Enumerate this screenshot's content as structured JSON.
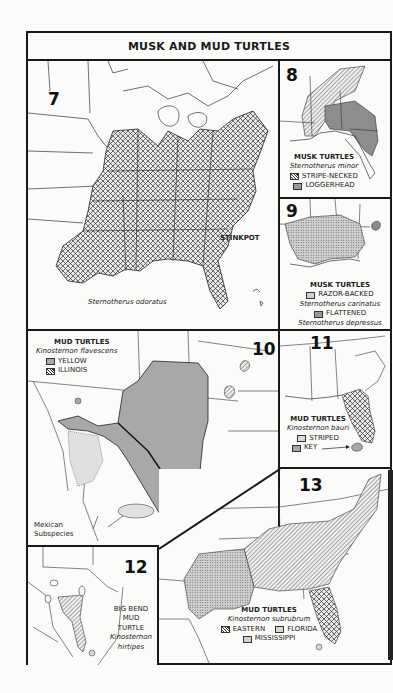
{
  "page": {
    "title": "MUSK AND MUD TURTLES"
  },
  "colors": {
    "ink": "#1a1a1a",
    "paper": "#fbfbf9",
    "gray_fill": "#a8a8a8",
    "light_fill": "#d6d6d6"
  },
  "maps": [
    {
      "number": "7",
      "common_name": "STINKPOT",
      "scientific_name": "Sternotherus odoratus",
      "pattern": "crosshatch"
    },
    {
      "number": "8",
      "group": "MUSK TURTLES",
      "scientific_name": "Sternotherus minor",
      "legend": [
        {
          "label": "STRIPE-NECKED",
          "pattern": "diagonal-hatch"
        },
        {
          "label": "LOGGERHEAD",
          "pattern": "dense-stipple"
        }
      ]
    },
    {
      "number": "9",
      "group": "MUSK TURTLES",
      "legend": [
        {
          "label": "RAZOR-BACKED",
          "scientific_name": "Sternotherus carinatus",
          "pattern": "stipple"
        },
        {
          "label": "FLATTENED",
          "scientific_name": "Sternotherus depressus",
          "pattern": "dark-stipple"
        }
      ]
    },
    {
      "number": "10",
      "group": "MUD TURTLES",
      "scientific_name": "Kinosternon flavescens",
      "legend": [
        {
          "label": "YELLOW",
          "pattern": "gray-solid"
        },
        {
          "label": "ILLINOIS",
          "pattern": "diagonal-hatch"
        }
      ],
      "annotation": "Mexican Subspecies",
      "annotation_lines": [
        "Mexican",
        "Subspecies"
      ]
    },
    {
      "number": "11",
      "group": "MUD TURTLES",
      "scientific_name": "Kinosternon bauri",
      "legend": [
        {
          "label": "STRIPED",
          "pattern": "crosshatch"
        },
        {
          "label": "KEY",
          "pattern": "gray-solid"
        }
      ]
    },
    {
      "number": "12",
      "name_lines": [
        "BIG BEND",
        "MUD",
        "TURTLE"
      ],
      "scientific_lines": [
        "Kinosternon",
        "hirtipes"
      ],
      "pattern": "diagonal-hatch"
    },
    {
      "number": "13",
      "group": "MUD TURTLES",
      "scientific_name": "Kinosternon subrubrum",
      "legend": [
        {
          "label": "EASTERN",
          "pattern": "diagonal-hatch"
        },
        {
          "label": "FLORIDA",
          "pattern": "crosshatch"
        },
        {
          "label": "MISSISSIPPI",
          "pattern": "stipple"
        }
      ]
    }
  ]
}
